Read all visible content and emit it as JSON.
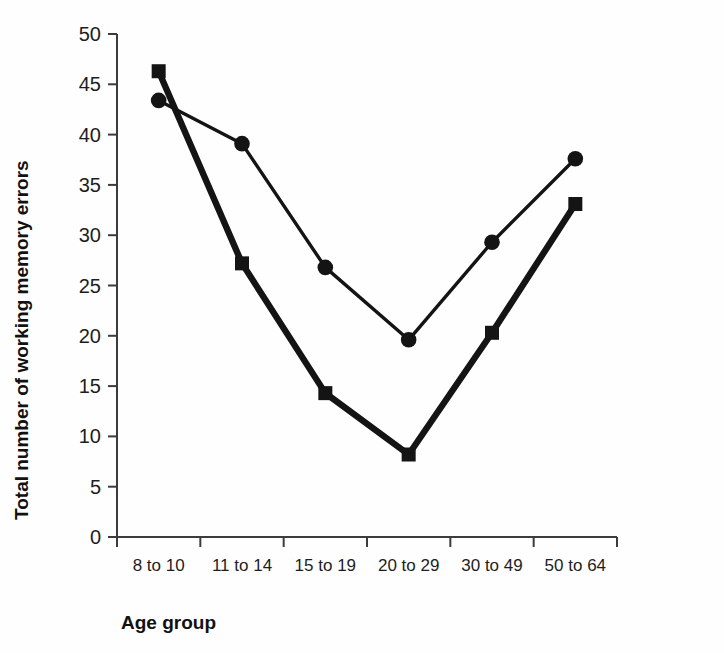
{
  "chart_data": {
    "type": "line",
    "title": "",
    "xlabel": "Age group",
    "ylabel": "Total number of working memory errors",
    "categories": [
      "8 to 10",
      "11 to 14",
      "15 to 19",
      "20 to 29",
      "30 to 49",
      "50 to 64"
    ],
    "series": [
      {
        "name": "circle-series",
        "marker": "circle",
        "line_weight": "thin",
        "values": [
          43.4,
          39.1,
          26.8,
          19.6,
          29.3,
          37.6
        ]
      },
      {
        "name": "square-series",
        "marker": "square",
        "line_weight": "thick",
        "values": [
          46.3,
          27.2,
          14.3,
          8.2,
          20.3,
          33.1
        ]
      }
    ],
    "ylim": [
      0,
      50
    ],
    "ytick_values": [
      0,
      5,
      10,
      15,
      20,
      25,
      30,
      35,
      40,
      45,
      50
    ],
    "ytick_labels": [
      "0",
      "5",
      "10",
      "15",
      "20",
      "25",
      "30",
      "35",
      "40",
      "45",
      "50"
    ],
    "grid": false,
    "legend": "none",
    "colors": {
      "series": "#141414",
      "axis": "#3c3c3c",
      "background": "#fefefe",
      "text": "#1d1d1d"
    }
  }
}
